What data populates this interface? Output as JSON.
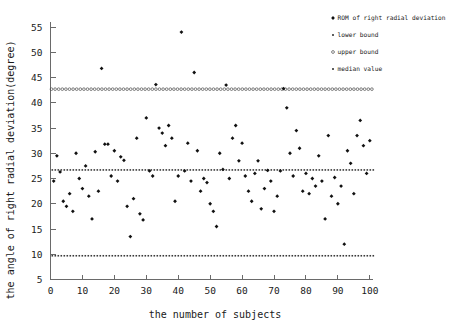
{
  "chart_data": {
    "type": "scatter",
    "title": "",
    "xlabel": "the number of subjects",
    "ylabel": "the angle of right radial deviation(degree)",
    "xlim": [
      0,
      101
    ],
    "ylim": [
      5,
      56
    ],
    "xticks": [
      0,
      10,
      20,
      30,
      40,
      50,
      60,
      70,
      80,
      90,
      100
    ],
    "yticks": [
      5,
      10,
      15,
      20,
      25,
      30,
      35,
      40,
      45,
      50,
      55
    ],
    "grid": false,
    "legend_position": "top-right-outside",
    "series": [
      {
        "name": "ROM of right radial deviation",
        "marker": "filled-diamond",
        "x": [
          1,
          2,
          3,
          4,
          5,
          6,
          7,
          8,
          9,
          10,
          11,
          12,
          13,
          14,
          15,
          16,
          17,
          18,
          19,
          20,
          21,
          22,
          23,
          24,
          25,
          26,
          27,
          28,
          29,
          30,
          31,
          32,
          33,
          34,
          35,
          36,
          37,
          38,
          39,
          40,
          41,
          42,
          43,
          44,
          45,
          46,
          47,
          48,
          49,
          50,
          51,
          52,
          53,
          54,
          55,
          56,
          57,
          58,
          59,
          60,
          61,
          62,
          63,
          64,
          65,
          66,
          67,
          68,
          69,
          70,
          71,
          72,
          73,
          74,
          75,
          76,
          77,
          78,
          79,
          80,
          81,
          82,
          83,
          84,
          85,
          86,
          87,
          88,
          89,
          90,
          91,
          92,
          93,
          94,
          95,
          96,
          97,
          98,
          99,
          100
        ],
        "y": [
          24.5,
          29.5,
          26.3,
          20.5,
          19.5,
          22.0,
          18.5,
          30.0,
          25.0,
          23.0,
          27.5,
          21.5,
          17.0,
          30.3,
          22.5,
          46.8,
          31.8,
          31.8,
          25.5,
          30.5,
          24.5,
          29.3,
          28.6,
          19.5,
          13.5,
          21.0,
          33.0,
          18.0,
          16.8,
          37.0,
          26.5,
          25.5,
          43.6,
          35.0,
          34.0,
          31.5,
          35.5,
          33.0,
          20.5,
          25.5,
          54.0,
          26.5,
          32.0,
          24.5,
          46.0,
          30.5,
          22.5,
          25.0,
          24.2,
          20.0,
          18.5,
          15.5,
          30.0,
          26.8,
          43.5,
          25.0,
          33.0,
          35.5,
          28.5,
          32.0,
          25.5,
          22.5,
          20.5,
          26.0,
          28.5,
          19.0,
          23.0,
          26.6,
          24.5,
          18.5,
          21.5,
          26.5,
          42.8,
          39.0,
          30.0,
          25.5,
          34.5,
          31.0,
          22.5,
          26.0,
          22.0,
          25.0,
          23.5,
          29.5,
          24.5,
          17.0,
          33.5,
          21.5,
          25.2,
          20.0,
          23.5,
          12.0,
          30.5,
          28.0,
          22.0,
          33.5,
          36.5,
          31.5,
          26.0,
          32.5
        ]
      },
      {
        "name": "lower bound",
        "marker": "dotted-line",
        "value": 9.7
      },
      {
        "name": "upper bound",
        "marker": "open-circle-line",
        "value": 42.7
      },
      {
        "name": "median value",
        "marker": "dotted-line",
        "value": 26.7
      }
    ]
  },
  "legend": {
    "items": [
      {
        "label": "ROM of right radial deviation",
        "marker": "filled-diamond"
      },
      {
        "label": "lower bound",
        "marker": "dotted-line"
      },
      {
        "label": "upper bound",
        "marker": "open-circle-line"
      },
      {
        "label": "median value",
        "marker": "dotted-line"
      }
    ]
  },
  "axes": {
    "x_title": "the number of subjects",
    "y_title": "the angle of right radial deviation(degree)",
    "x_tick_labels": [
      "0",
      "10",
      "20",
      "30",
      "40",
      "50",
      "60",
      "70",
      "80",
      "90",
      "100"
    ],
    "y_tick_labels": [
      "5",
      "10",
      "15",
      "20",
      "25",
      "30",
      "35",
      "40",
      "45",
      "50",
      "55"
    ]
  },
  "colors": {
    "point": "#111111",
    "axis": "#6a6a6a",
    "reference_line": "#4a4a4a",
    "background": "#ffffff"
  }
}
